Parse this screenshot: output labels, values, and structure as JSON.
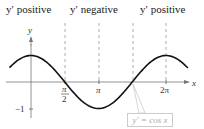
{
  "chart_data": {
    "type": "line",
    "title": "",
    "xlabel": "x",
    "ylabel": "y",
    "x_ticks": [
      "π/2",
      "π",
      "2π"
    ],
    "y_ticks": [
      "-1"
    ],
    "series": [
      {
        "name": "y' = cos x",
        "function": "cos(x)",
        "x_range": [
          -1.0,
          7.3
        ]
      }
    ],
    "regions": [
      {
        "label": "y′ positive",
        "x_range": [
          0,
          1.5708
        ]
      },
      {
        "label": "y′ negative",
        "x_range": [
          1.5708,
          4.7124
        ]
      },
      {
        "label": "y′ positive",
        "x_range": [
          4.7124,
          6.2832
        ]
      }
    ],
    "vertical_dashed_lines": [
      "0",
      "π/2",
      "π",
      "3π/2",
      "2π"
    ],
    "grid": false
  },
  "labels": {
    "region1": "y′ positive",
    "region2": "y′ negative",
    "region3": "y′ positive",
    "curve": "y′ = cos x",
    "x_axis": "x",
    "y_axis": "y",
    "tick_pi_half_num": "π",
    "tick_pi_half_den": "2",
    "tick_pi": "π",
    "tick_2pi": "2π",
    "tick_neg1": "−1"
  }
}
